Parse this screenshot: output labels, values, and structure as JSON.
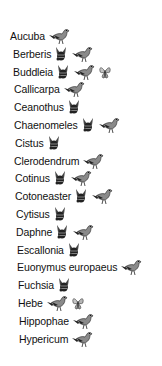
{
  "legend_icons": {
    "bird": {
      "name": "bird-icon",
      "color": "#8a8a8a"
    },
    "bee": {
      "name": "bee-icon",
      "color": "#222222"
    },
    "butterfly": {
      "name": "butterfly-icon",
      "color": "#b5b5b5"
    }
  },
  "plants": [
    {
      "label": "Aucuba",
      "icons": [
        "bird"
      ]
    },
    {
      "label": "Berberis",
      "icons": [
        "bee",
        "bird"
      ]
    },
    {
      "label": "Buddleia",
      "icons": [
        "bee",
        "bird",
        "butterfly"
      ]
    },
    {
      "label": "Callicarpa",
      "icons": [
        "bird"
      ]
    },
    {
      "label": "Ceanothus",
      "icons": [
        "bee"
      ]
    },
    {
      "label": "Chaenomeles",
      "icons": [
        "bee",
        "bird"
      ]
    },
    {
      "label": "Cistus",
      "icons": [
        "bee"
      ]
    },
    {
      "label": "Clerodendrum",
      "icons": [
        "bird"
      ]
    },
    {
      "label": "Cotinus",
      "icons": [
        "bee",
        "bird"
      ]
    },
    {
      "label": "Cotoneaster",
      "icons": [
        "bee",
        "bird"
      ]
    },
    {
      "label": "Cytisus",
      "icons": [
        "bee"
      ]
    },
    {
      "label": "Daphne",
      "icons": [
        "bee",
        "bird"
      ]
    },
    {
      "label": "Escallonia",
      "icons": [
        "bee"
      ]
    },
    {
      "label": "Euonymus europaeus",
      "icons": [
        "bird"
      ]
    },
    {
      "label": "Fuchsia",
      "icons": [
        "bee"
      ]
    },
    {
      "label": "Hebe",
      "icons": [
        "bird",
        "butterfly"
      ]
    },
    {
      "label": "Hippophae",
      "icons": [
        "bird"
      ]
    },
    {
      "label": "Hypericum",
      "icons": [
        "bird"
      ]
    }
  ]
}
